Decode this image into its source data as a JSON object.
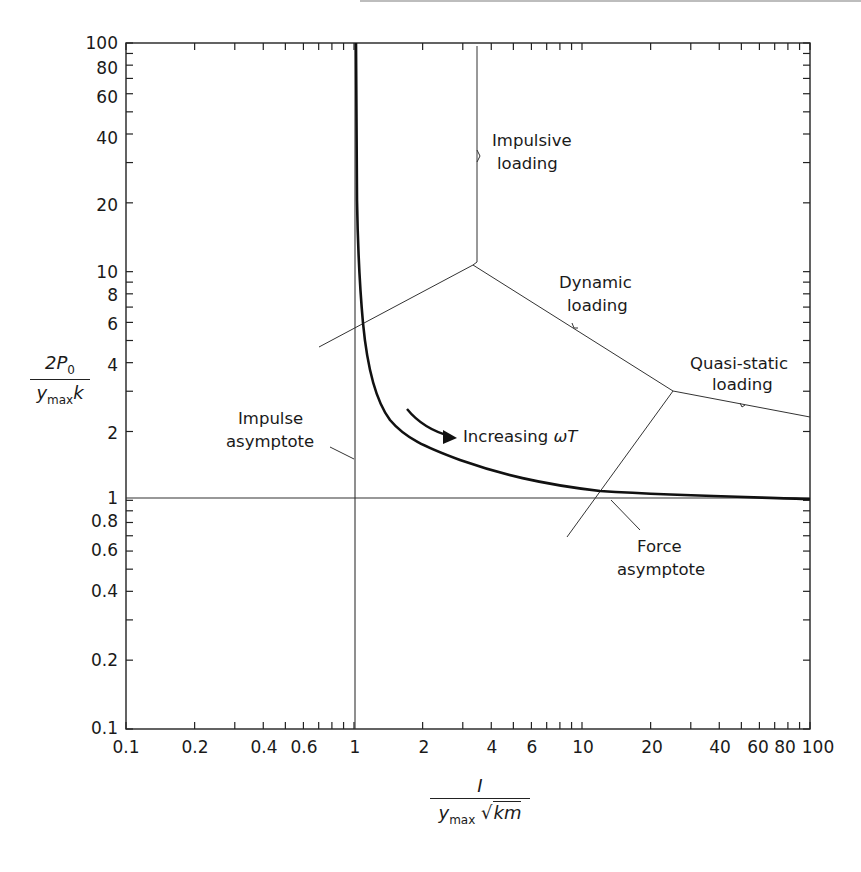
{
  "chart_data": {
    "type": "line",
    "title": "",
    "xscale": "log",
    "yscale": "log",
    "xlim": [
      0.1,
      100
    ],
    "ylim": [
      0.1,
      100
    ],
    "xlabel": {
      "numerator": "I",
      "denominator_var": "y",
      "denominator_sub": "max",
      "denominator_root": "km"
    },
    "ylabel": {
      "numerator": "2P",
      "numerator_sub": "0",
      "denominator_var": "y",
      "denominator_sub": "max",
      "denominator_tail": "k"
    },
    "x_ticks": [
      "0.1",
      "0.2",
      "0.4",
      "0.6",
      "1",
      "2",
      "4",
      "6",
      "10",
      "20",
      "40",
      "60",
      "80",
      "100"
    ],
    "y_ticks": [
      "100",
      "80",
      "60",
      "40",
      "20",
      "10",
      "8",
      "6",
      "4",
      "2",
      "1",
      "0.8",
      "0.6",
      "0.4",
      "0.2",
      "0.1"
    ],
    "grid": false,
    "series": [
      {
        "name": "Shock spectrum curve",
        "x": [
          1.0,
          1.0,
          1.02,
          1.05,
          1.12,
          1.3,
          1.6,
          2.0,
          3.0,
          5.0,
          10.0,
          20.0,
          50.0,
          100.0
        ],
        "y": [
          100,
          20,
          10,
          6.0,
          4.0,
          2.8,
          2.1,
          1.8,
          1.5,
          1.3,
          1.15,
          1.07,
          1.03,
          1.0
        ]
      },
      {
        "name": "Impulse asymptote",
        "x": [
          1,
          1
        ],
        "y": [
          0.1,
          100
        ]
      },
      {
        "name": "Force asymptote",
        "x": [
          0.1,
          100
        ],
        "y": [
          1,
          1
        ]
      },
      {
        "name": "Impulsive/dynamic boundary",
        "x": [
          0.8,
          3.3,
          3.3
        ],
        "y": [
          5.0,
          10.5,
          100
        ]
      },
      {
        "name": "Dynamic/quasi-static boundary",
        "x": [
          3.3,
          25,
          100
        ],
        "y": [
          10.5,
          3.1,
          2.3
        ]
      },
      {
        "name": "Quasi-static lower boundary",
        "x": [
          25,
          9.5
        ],
        "y": [
          3.1,
          0.72
        ]
      }
    ],
    "annotations": [
      {
        "text": [
          "Impulsive",
          "loading"
        ]
      },
      {
        "text": [
          "Dynamic",
          "loading"
        ]
      },
      {
        "text": [
          "Quasi-static",
          "loading"
        ]
      },
      {
        "text": [
          "Impulse",
          "asymptote"
        ]
      },
      {
        "text": [
          "Force",
          "asymptote"
        ]
      },
      {
        "text": "Increasing ωT"
      }
    ]
  },
  "labels": {
    "impulsive_1": "Impulsive",
    "impulsive_2": "loading",
    "dynamic_1": "Dynamic",
    "dynamic_2": "loading",
    "quasi_1": "Quasi-static",
    "quasi_2": "loading",
    "impulse_asym_1": "Impulse",
    "impulse_asym_2": "asymptote",
    "force_asym_1": "Force",
    "force_asym_2": "asymptote",
    "increasing": "Increasing ",
    "omegaT": "ωT"
  },
  "axis": {
    "y_num": "2P",
    "y_num_sub": "0",
    "y_den": "y",
    "y_den_sub": "max",
    "y_den_tail": "k",
    "x_num": "I",
    "x_den": "y",
    "x_den_sub": "max",
    "x_den_root": "km"
  }
}
